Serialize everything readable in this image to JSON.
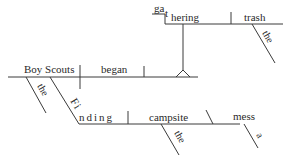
{
  "diagram": {
    "type": "sentence-diagram",
    "sentence_parts": {
      "subject": "Boy Scouts",
      "subject_modifier": "the",
      "verb": "began",
      "gerund_phrase_object": {
        "gerund_part1": "ga",
        "gerund_part2": "t",
        "gerund_part3": "hering",
        "object": "trash",
        "object_modifier": "the"
      },
      "gerund_phrase_subject_modifier": {
        "gerund_part1": "Fi",
        "gerund_part2": "nding",
        "object": "campsite",
        "object_modifier": "the",
        "complement": "mess",
        "complement_modifier": "a"
      }
    }
  }
}
